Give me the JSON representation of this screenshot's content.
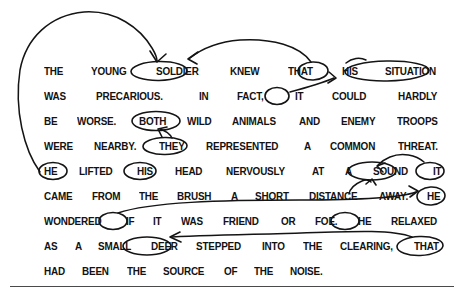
{
  "document": {
    "type": "handwriting-annotated-worksheet",
    "ink_color": "#141414",
    "text_color": "#121212",
    "background": "#ffffff",
    "passage_lines": [
      {
        "id": "line-1",
        "words": [
          "THE",
          "YOUNG",
          "SOLDIER",
          "KNEW",
          "THAT",
          "HIS",
          "SITUATION"
        ]
      },
      {
        "id": "line-2",
        "words": [
          "WAS",
          "PRECARIOUS.",
          "IN",
          "FACT,",
          "IT",
          "COULD",
          "HARDLY"
        ]
      },
      {
        "id": "line-3",
        "words": [
          "BE",
          "WORSE.",
          "BOTH",
          "WILD",
          "ANIMALS",
          "AND",
          "ENEMY",
          "TROOPS"
        ]
      },
      {
        "id": "line-4",
        "words": [
          "WERE",
          "NEARBY.",
          "THEY",
          "REPRESENTED",
          "A",
          "COMMON",
          "THREAT."
        ]
      },
      {
        "id": "line-5",
        "words": [
          "HE",
          "LIFTED",
          "HIS",
          "HEAD",
          "NERVOUSLY",
          "AT",
          "A",
          "SOUND",
          "IT"
        ]
      },
      {
        "id": "line-6",
        "words": [
          "CAME",
          "FROM",
          "THE",
          "BRUSH",
          "A",
          "SHORT",
          "DISTANCE",
          "AWAY.",
          "HE"
        ]
      },
      {
        "id": "line-7",
        "words": [
          "WONDERED",
          "IF",
          "IT",
          "WAS",
          "FRIEND",
          "OR",
          "FOE.",
          "HE",
          "RELAXED"
        ]
      },
      {
        "id": "line-8",
        "words": [
          "AS",
          "A",
          "SMALL",
          "DEER",
          "STEPPED",
          "INTO",
          "THE",
          "CLEARING,",
          "THAT"
        ]
      },
      {
        "id": "line-9",
        "words": [
          "HAD",
          "BEEN",
          "THE",
          "SOURCE",
          "OF",
          "THE",
          "NOISE."
        ]
      }
    ],
    "circled_words": [
      "SOLDIER",
      "HIS",
      "SITUATION",
      "IT",
      "BOTH",
      "THEY",
      "HE",
      "HIS",
      "SOUND",
      "IT",
      "HE",
      "IT",
      "HE",
      "DEER",
      "THAT"
    ],
    "arrows": [
      {
        "id": "arrow-he-to-soldier",
        "from": "HE (line 5)",
        "to": "SOLDIER (line 1)"
      },
      {
        "id": "arrow-his-to-soldier",
        "from": "HIS (line 1)",
        "to": "SOLDIER (line 1)"
      },
      {
        "id": "arrow-it-to-situation",
        "from": "IT (line 2)",
        "to": "SITUATION (line 1)"
      },
      {
        "id": "arrow-they-to-both",
        "from": "THEY (line 4)",
        "to": "BOTH (line 3)"
      },
      {
        "id": "arrow-it-to-sound",
        "from": "IT (line 5)",
        "to": "SOUND (line 5)"
      },
      {
        "id": "arrow-distance-to-sound",
        "from": "DISTANCE (line 6)",
        "to": "SOUND (line 5)"
      },
      {
        "id": "arrow-it-to-he",
        "from": "IT (line 7)",
        "to": "HE (line 6)"
      },
      {
        "id": "arrow-that-to-deer",
        "from": "THAT (line 8)",
        "to": "DEER (line 8)"
      }
    ]
  }
}
